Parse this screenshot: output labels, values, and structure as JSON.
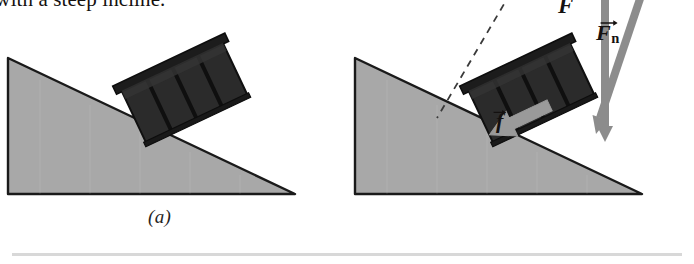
{
  "figure": {
    "title_fragment": "ad with a steep incline.",
    "divider_color": "#d8d8d8"
  },
  "colors": {
    "incline_fill": "#a8a8a8",
    "incline_edge": "#1a1a1a",
    "crate_dark": "#2b2b2b",
    "crate_slat": "#141414",
    "crate_rail": "#1c1c1c",
    "vector_gray": "#8c8c8c",
    "vector_gray_dark": "#777777",
    "friction_gray": "#9a9a9a",
    "dashed_line": "#3a3a3a",
    "label_black": "#141110",
    "background": "#ffffff"
  },
  "panels": [
    {
      "id": "a",
      "label": "(a)",
      "description": "Crate resting on a steep incline with no force vectors shown.",
      "has_vectors": false
    },
    {
      "id": "b",
      "label": "(b)",
      "description": "Same crate on the incline with applied force, normal force and friction force vectors drawn.",
      "has_vectors": true
    }
  ],
  "vectors": [
    {
      "name": "applied-force",
      "symbol": "F",
      "subscript": "",
      "arrow_accent": "vector-arrow",
      "direction": "vertical downward onto crate",
      "color": "#8c8c8c"
    },
    {
      "name": "normal-force",
      "symbol": "F",
      "subscript": "n",
      "arrow_accent": "vector-arrow",
      "direction": "tilted, perpendicular to incline surface",
      "color": "#8c8c8c"
    },
    {
      "name": "friction-force",
      "symbol": "f",
      "subscript": "",
      "arrow_accent": "vector-arrow",
      "direction": "down the incline, to the lower left",
      "color": "#9a9a9a"
    }
  ],
  "guides": [
    {
      "name": "dashed-reference-line",
      "style": "dashed",
      "description": "Dashed construction line from upper area down to the incline surface."
    }
  ]
}
